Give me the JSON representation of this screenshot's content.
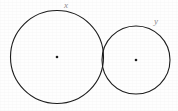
{
  "figure": {
    "background_color": "#fefefe",
    "stroke_color": "#1c1c1c",
    "label_color": "#8d8d8d",
    "width": 178,
    "height": 111
  },
  "circles": [
    {
      "id": "large-circle",
      "label": "x",
      "cx": 57,
      "cy": 57,
      "r": 46.5,
      "stroke_width": 1.1,
      "center_dot_r": 1.3,
      "label_x": 68,
      "label_y": 6
    },
    {
      "id": "small-circle",
      "label": "y",
      "cx": 136,
      "cy": 60,
      "r": 34,
      "stroke_width": 1.1,
      "center_dot_r": 1.3,
      "label_x": 158,
      "label_y": 22
    }
  ],
  "tangency": {
    "point_x": 103,
    "point_y": 58,
    "relation": "externally tangent"
  }
}
